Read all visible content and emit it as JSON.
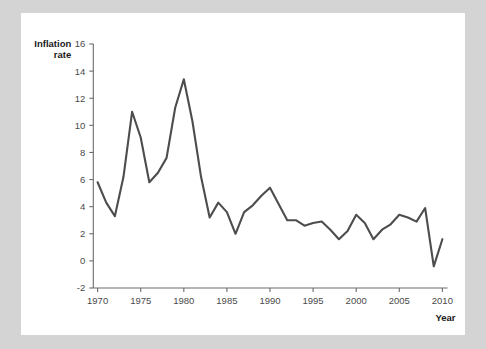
{
  "panel": {
    "background_color": "#ffffff",
    "page_background_color": "#d4d4d4"
  },
  "axis_titles": {
    "y_line1": "Inflation",
    "y_line2": "rate",
    "x": "Year"
  },
  "chart_data": {
    "type": "line",
    "title": "",
    "xlabel": "Year",
    "ylabel": "Inflation rate",
    "xlim": [
      1969,
      2011
    ],
    "ylim": [
      -2,
      16
    ],
    "grid": false,
    "legend": false,
    "line_color": "#4d4d4d",
    "y_ticks": [
      -2,
      0,
      2,
      4,
      6,
      8,
      10,
      12,
      14,
      16
    ],
    "x_ticks": [
      1970,
      1975,
      1980,
      1985,
      1990,
      1995,
      2000,
      2005,
      2010
    ],
    "x": [
      1970,
      1971,
      1972,
      1973,
      1974,
      1975,
      1976,
      1977,
      1978,
      1979,
      1980,
      1981,
      1982,
      1983,
      1984,
      1985,
      1986,
      1987,
      1988,
      1989,
      1990,
      1991,
      1992,
      1993,
      1994,
      1995,
      1996,
      1997,
      1998,
      1999,
      2000,
      2001,
      2002,
      2003,
      2004,
      2005,
      2006,
      2007,
      2008,
      2009,
      2010
    ],
    "values": [
      5.8,
      4.3,
      3.3,
      6.2,
      11.0,
      9.1,
      5.8,
      6.5,
      7.6,
      11.3,
      13.4,
      10.3,
      6.2,
      3.2,
      4.3,
      3.6,
      2.0,
      3.6,
      4.1,
      4.8,
      5.4,
      4.2,
      3.0,
      3.0,
      2.6,
      2.8,
      2.9,
      2.3,
      1.6,
      2.2,
      3.4,
      2.8,
      1.6,
      2.3,
      2.7,
      3.4,
      3.2,
      2.9,
      3.9,
      -0.4,
      1.6
    ]
  }
}
